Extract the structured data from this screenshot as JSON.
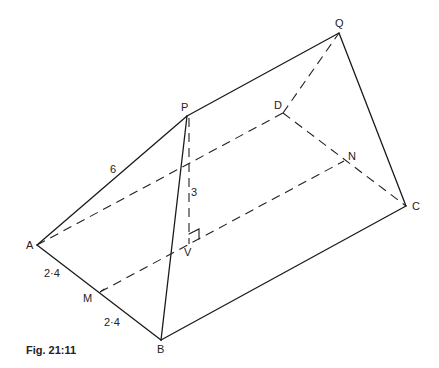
{
  "figure": {
    "caption": "Fig. 21:11",
    "points": {
      "P": {
        "label": "P",
        "x": 187,
        "y": 116
      },
      "Q": {
        "label": "Q",
        "x": 339,
        "y": 33
      },
      "D": {
        "label": "D",
        "x": 283,
        "y": 113
      },
      "N": {
        "label": "N",
        "x": 344,
        "y": 161
      },
      "C": {
        "label": "C",
        "x": 406,
        "y": 206
      },
      "A": {
        "label": "A",
        "x": 37,
        "y": 245
      },
      "M": {
        "label": "M",
        "x": 100,
        "y": 292
      },
      "B": {
        "label": "B",
        "x": 161,
        "y": 340
      },
      "V": {
        "label": "V",
        "x": 189,
        "y": 244
      }
    },
    "measurements": {
      "AP": "6",
      "PV": "3",
      "AM": "2·4",
      "MB": "2·4"
    }
  }
}
